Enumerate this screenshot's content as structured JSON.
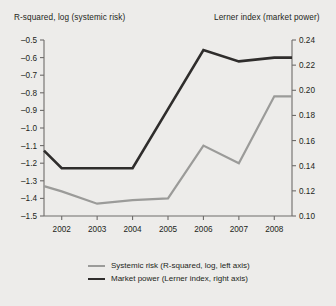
{
  "titles": {
    "left_axis": "R-squared, log (systemic risk)",
    "right_axis": "Lerner index (market power)"
  },
  "legend": {
    "items": [
      {
        "key": "systemic_risk",
        "label": "Systemic risk (R-squared, log, left axis)",
        "color": "#9b9b99"
      },
      {
        "key": "market_power",
        "label": "Market power (Lerner index, right axis)",
        "color": "#2f2d2c"
      }
    ]
  },
  "chart_data": {
    "type": "line",
    "title": "",
    "xlabel": "",
    "grid": false,
    "legend_position": "bottom",
    "x": [
      2001.5,
      2002,
      2003,
      2004,
      2005,
      2006,
      2007,
      2008,
      2008.5
    ],
    "xtick_labels": [
      "2002",
      "2003",
      "2004",
      "2005",
      "2006",
      "2007",
      "2008"
    ],
    "xticks": [
      2002,
      2003,
      2004,
      2005,
      2006,
      2007,
      2008
    ],
    "xlim": [
      2001.5,
      2008.5
    ],
    "left_axis": {
      "label": "R-squared, log (systemic risk)",
      "ylim": [
        -1.5,
        -0.5
      ],
      "ticks": [
        -0.5,
        -0.6,
        -0.7,
        -0.8,
        -0.9,
        -1.0,
        -1.1,
        -1.2,
        -1.3,
        -1.4,
        -1.5
      ],
      "tick_labels": [
        "-0.5",
        "-0.6",
        "-0.7",
        "-0.8",
        "-0.9",
        "-1.0",
        "-1.1",
        "-1.2",
        "-1.3",
        "-1.4",
        "-1.5"
      ]
    },
    "right_axis": {
      "label": "Lerner index (market power)",
      "ylim": [
        0.1,
        0.24
      ],
      "ticks": [
        0.24,
        0.22,
        0.2,
        0.18,
        0.16,
        0.14,
        0.12,
        0.1
      ],
      "tick_labels": [
        "0.24",
        "0.22",
        "0.20",
        "0.18",
        "0.16",
        "0.14",
        "0.12",
        "0.10"
      ]
    },
    "series": [
      {
        "name": "Systemic risk (R-squared, log, left axis)",
        "axis": "left",
        "color": "#9b9b99",
        "x": [
          2001.5,
          2002,
          2003,
          2004,
          2005,
          2006,
          2007,
          2008,
          2008.5
        ],
        "values": [
          -1.33,
          -1.36,
          -1.43,
          -1.41,
          -1.4,
          -1.1,
          -1.2,
          -0.82,
          -0.82
        ]
      },
      {
        "name": "Market power (Lerner index, right axis)",
        "axis": "right",
        "color": "#2f2d2c",
        "x": [
          2001.5,
          2002,
          2003,
          2004,
          2005,
          2006,
          2007,
          2008,
          2008.5
        ],
        "values": [
          0.152,
          0.138,
          0.138,
          0.138,
          0.185,
          0.232,
          0.223,
          0.226,
          0.226
        ]
      }
    ]
  }
}
